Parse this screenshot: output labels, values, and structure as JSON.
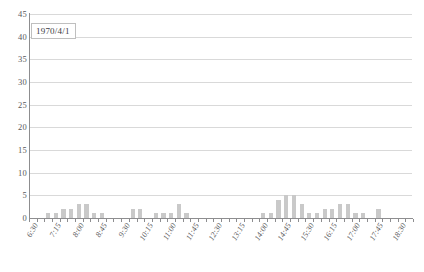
{
  "chart_data": {
    "type": "bar",
    "title": "",
    "subtitle": "",
    "xlabel": "",
    "ylabel": "",
    "annotation": "1970/4/1",
    "grid": true,
    "legend": false,
    "ylim": [
      0,
      45
    ],
    "yticks": [
      0,
      5,
      10,
      15,
      20,
      25,
      30,
      35,
      40,
      45
    ],
    "ytick_labels": [
      "0",
      "5",
      "10",
      "15",
      "20",
      "25",
      "30",
      "35",
      "40",
      "45"
    ],
    "xtick_labels": [
      "6:30",
      "7:15",
      "8:00",
      "8:45",
      "9:30",
      "10:15",
      "11:00",
      "11:45",
      "12:30",
      "13:15",
      "14:00",
      "14:45",
      "15:30",
      "16:15",
      "17:00",
      "17:45",
      "18:30"
    ],
    "x_interval_minutes": 15,
    "x_start": "6:30",
    "x_end": "18:45",
    "bar_color": "#c9c9c9",
    "grid_color": "#d9d9d9",
    "axis_color": "#8d8d8f",
    "categories": [
      "6:30",
      "6:45",
      "7:00",
      "7:15",
      "7:30",
      "7:45",
      "8:00",
      "8:15",
      "8:30",
      "8:45",
      "9:00",
      "9:15",
      "9:30",
      "9:45",
      "10:00",
      "10:15",
      "10:30",
      "10:45",
      "11:00",
      "11:15",
      "11:30",
      "11:45",
      "12:00",
      "12:15",
      "12:30",
      "12:45",
      "13:00",
      "13:15",
      "13:30",
      "13:45",
      "14:00",
      "14:15",
      "14:30",
      "14:45",
      "15:00",
      "15:15",
      "15:30",
      "15:45",
      "16:00",
      "16:15",
      "16:30",
      "16:45",
      "17:00",
      "17:15",
      "17:30",
      "17:45",
      "18:00",
      "18:15",
      "18:30",
      "18:45"
    ],
    "values": [
      0,
      0,
      1,
      1,
      2,
      2,
      3,
      3,
      1,
      1,
      0,
      0,
      0,
      2,
      2,
      0,
      1,
      1,
      1,
      3,
      1,
      0,
      0,
      0,
      0,
      0,
      0,
      0,
      0,
      0,
      1,
      1,
      4,
      5,
      5,
      3,
      1,
      1,
      2,
      2,
      3,
      3,
      1,
      1,
      0,
      2,
      0,
      0,
      0,
      0
    ]
  }
}
